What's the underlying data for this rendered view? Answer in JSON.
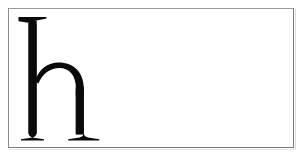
{
  "image": {
    "kind": "type-specimen-scan",
    "subject_character": "h",
    "character_case": "lowercase",
    "typeface_style": "Didone / Modern serif (high stroke contrast)",
    "alt_text": "Lowercase serif letter h printed in black inside a thin gray rectangular frame on white paper",
    "page_background": "#ffffff"
  },
  "frame": {
    "name": "specimen-frame",
    "border_color_top": "#9a9a9e",
    "border_color_left": "#8e8e92",
    "border_color_right": "#76767a",
    "border_color_bottom": "#7c7c80",
    "border_width_px": 1,
    "x": 8,
    "y": 8,
    "width": 286,
    "height": 140,
    "fill": "#ffffff"
  },
  "glyph": {
    "name": "letter-h",
    "character": "h",
    "ink_color": "#0a0a0a",
    "x": 18,
    "y": 16,
    "width": 95,
    "height": 124,
    "ascender_top_y": 16,
    "baseline_y": 139,
    "x_height_top_y": 63,
    "left_stem_x": 27,
    "left_stem_width": 20,
    "right_stem_x": 85,
    "right_stem_width": 20,
    "features": [
      "flat slab serif on ascender",
      "hairline baseline serifs",
      "thin arched shoulder",
      "high stroke contrast"
    ]
  },
  "artifacts": {
    "paper_shadow_color": "#e8e8ea",
    "scan_edge_color": "#dcdcde"
  }
}
